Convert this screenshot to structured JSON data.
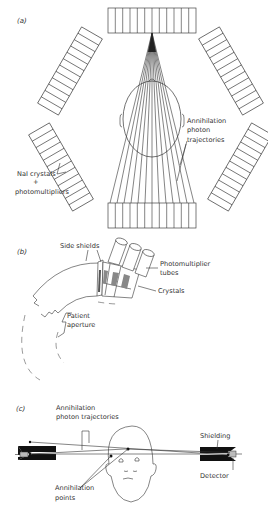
{
  "figure": {
    "panels": [
      {
        "id": "a",
        "label": "(a)",
        "title": "Hexagonal PET ring of detector banks",
        "labels": {
          "trajectories_1": "Annihilation",
          "trajectories_2": "photon",
          "trajectories_3": "trajectories",
          "crystals_1": "NaI crystals",
          "crystals_2": "+",
          "crystals_3": "photomultipliers"
        },
        "detector_banks": 6,
        "elements_per_bank": 12
      },
      {
        "id": "b",
        "label": "(b)",
        "title": "Detector ring cross-section",
        "labels": {
          "side_shields": "Side shields",
          "pmt_1": "Photomultiplier",
          "pmt_2": "tubes",
          "crystals": "Crystals",
          "aperture_1": "Patient",
          "aperture_2": "aperture"
        }
      },
      {
        "id": "c",
        "label": "(c)",
        "title": "Coincidence detection geometry",
        "labels": {
          "traj_1": "Annihilation",
          "traj_2": "photon trajectories",
          "shielding": "Shielding",
          "detector": "Detector",
          "points_1": "Annihilation",
          "points_2": "points"
        }
      }
    ]
  }
}
